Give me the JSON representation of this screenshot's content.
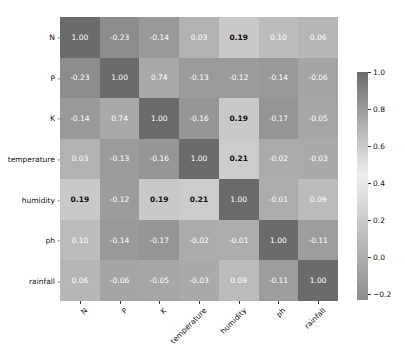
{
  "chart_data": {
    "type": "heatmap",
    "title": "",
    "xlabel": "",
    "ylabel": "",
    "x_labels": [
      "N",
      "P",
      "K",
      "temperature",
      "humidity",
      "ph",
      "rainfall"
    ],
    "y_labels": [
      "N",
      "P",
      "K",
      "temperature",
      "humidity",
      "ph",
      "rainfall"
    ],
    "values": [
      [
        1.0,
        -0.23,
        -0.14,
        0.03,
        0.19,
        0.1,
        0.06
      ],
      [
        -0.23,
        1.0,
        0.74,
        -0.13,
        -0.12,
        -0.14,
        -0.06
      ],
      [
        -0.14,
        0.74,
        1.0,
        -0.16,
        0.19,
        -0.17,
        -0.05
      ],
      [
        0.03,
        -0.13,
        -0.16,
        1.0,
        0.21,
        -0.02,
        -0.03
      ],
      [
        0.19,
        -0.12,
        0.19,
        0.21,
        1.0,
        -0.01,
        0.09
      ],
      [
        0.1,
        -0.14,
        -0.17,
        -0.02,
        -0.01,
        1.0,
        -0.11
      ],
      [
        0.06,
        -0.06,
        -0.05,
        -0.03,
        0.09,
        -0.11,
        1.0
      ]
    ],
    "annotations_format": "0.00",
    "colorbar": {
      "ticks": [
        "1.0",
        "0.8",
        "0.6",
        "0.4",
        "0.2",
        "0.0",
        "-0.2"
      ],
      "range": [
        -0.23,
        1.0
      ]
    },
    "colors": {
      "high": "#6b6b6b",
      "mid": "#efefef",
      "low": "#8c8c8c"
    },
    "grid": false,
    "legend_position": "right"
  }
}
